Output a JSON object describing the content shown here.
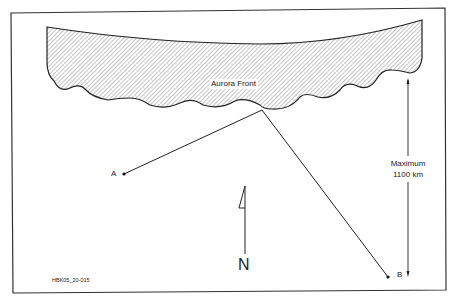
{
  "diagram": {
    "aurora_label": "Aurora Front",
    "point_a_label": "A",
    "point_b_label": "B",
    "distance_label_line1": "Maximum",
    "distance_label_line2": "1100 km",
    "north_label": "N",
    "figure_id": "HBK05_20-015"
  },
  "colors": {
    "stroke": "#222222",
    "hatch": "#888888",
    "background": "#ffffff"
  }
}
